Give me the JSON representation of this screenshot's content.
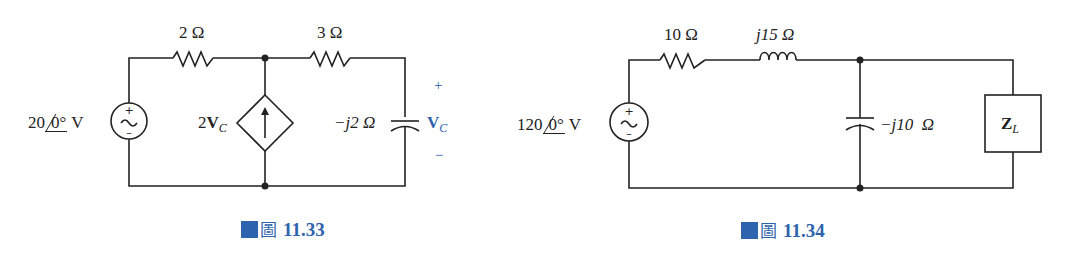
{
  "figures": [
    {
      "caption": {
        "prefix": "圖",
        "number": "11.33"
      },
      "source": {
        "magnitude": "20",
        "angle": "0°",
        "unit": "V",
        "plus": "+",
        "minus": "−"
      },
      "resistor1": {
        "value": "2 Ω"
      },
      "resistor2": {
        "value": "3 Ω"
      },
      "dependent_source": {
        "gain": "2",
        "var": "V",
        "sub": "C"
      },
      "capacitor": {
        "value": "−j2 Ω"
      },
      "vc": {
        "plus": "+",
        "minus": "−",
        "var": "V",
        "sub": "C"
      }
    },
    {
      "caption": {
        "prefix": "圖",
        "number": "11.34"
      },
      "source": {
        "magnitude": "120",
        "angle": "0°",
        "unit": "V",
        "plus": "+",
        "minus": "−"
      },
      "resistor": {
        "value": "10 Ω"
      },
      "inductor": {
        "value": "j15 Ω"
      },
      "capacitor": {
        "value": "−j10  Ω"
      },
      "load": {
        "var": "Z",
        "sub": "L"
      }
    }
  ],
  "colors": {
    "accent": "#2e63ad",
    "wire": "#222222"
  }
}
